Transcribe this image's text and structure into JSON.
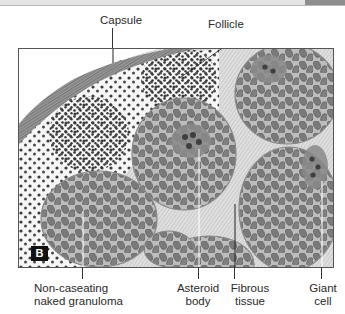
{
  "figure": {
    "panel_label": "B",
    "colors": {
      "background": "#ffffff",
      "tissue_light": "#f1f1f1",
      "nucleus": "#6e6e6e",
      "nucleus_dark": "#3c3c3c",
      "capsule": "#8a8a8a",
      "line": "#333333",
      "badge": "#111111"
    }
  },
  "labels": {
    "capsule": "Capsule",
    "follicle": "Follicle",
    "granuloma_line1": "Non-caseating",
    "granuloma_line2": "naked granuloma",
    "asteroid_line1": "Asteroid",
    "asteroid_line2": "body",
    "fibrous_line1": "Fibrous",
    "fibrous_line2": "tissue",
    "giant_line1": "Giant",
    "giant_line2": "cell"
  }
}
